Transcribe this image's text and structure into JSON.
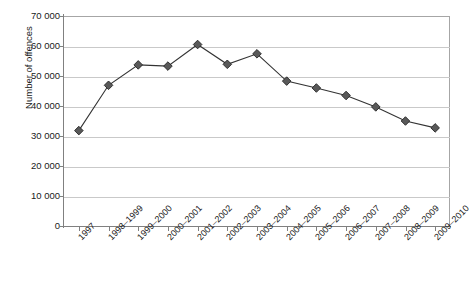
{
  "chart_data": {
    "type": "line",
    "title": "",
    "xlabel": "",
    "ylabel": "Number of offences",
    "ylim": [
      0,
      70000
    ],
    "yticks": [
      0,
      10000,
      20000,
      30000,
      40000,
      50000,
      60000,
      70000
    ],
    "ytick_labels": [
      "0",
      "10 000",
      "20 000",
      "30 000",
      "40 000",
      "50 000",
      "60 000",
      "70 000"
    ],
    "grid": true,
    "legend": "none",
    "marker": "diamond",
    "marker_color": "#595959",
    "line_color": "#333333",
    "categories": [
      "1997",
      "1998–1999",
      "1999–2000",
      "2000–2001",
      "2001–2002",
      "2002–2003",
      "2003–2004",
      "2004–2005",
      "2005–2006",
      "2006–2007",
      "2007–2008",
      "2008–2009",
      "2009–2010"
    ],
    "values": [
      31800,
      46900,
      53700,
      53300,
      60500,
      53900,
      57400,
      48300,
      46000,
      43500,
      39700,
      35000,
      32700
    ]
  }
}
